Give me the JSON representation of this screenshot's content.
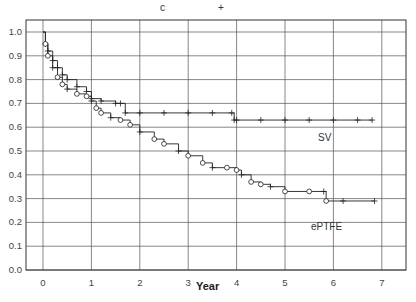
{
  "header_marks": {
    "circle_mark": "c",
    "plus_mark": "+"
  },
  "axes": {
    "xlabel": "Year",
    "xticks": [
      "0",
      "1",
      "2",
      "3",
      "4",
      "5",
      "6",
      "7"
    ],
    "yticks": [
      "1.0",
      "0.9",
      "0.8",
      "0.7",
      "0.6",
      "0.5",
      "0.4",
      "0.3",
      "0.2",
      "0.1",
      "0.0"
    ]
  },
  "labels": {
    "sv": "SV",
    "eptfe": "ePTFE"
  },
  "chart_data": {
    "type": "line",
    "subtype": "kaplan-meier step survival curve",
    "title": "",
    "xlabel": "Year",
    "ylabel": "",
    "xlim": [
      -0.1,
      7.5
    ],
    "ylim": [
      0.0,
      1.05
    ],
    "grid": true,
    "legend": "inline labels (SV above upper curve, ePTFE below lower curve)",
    "series": [
      {
        "name": "SV",
        "marker": "+ (censored)",
        "x": [
          0,
          0.05,
          0.1,
          0.2,
          0.3,
          0.4,
          0.5,
          0.7,
          0.9,
          1.0,
          1.2,
          1.5,
          1.6,
          1.7,
          2.0,
          2.5,
          3.0,
          3.5,
          3.9,
          3.95,
          4.0,
          4.5,
          5.0,
          5.5,
          6.0,
          6.5,
          6.8
        ],
        "y": [
          1.0,
          0.95,
          0.92,
          0.88,
          0.85,
          0.82,
          0.8,
          0.77,
          0.75,
          0.72,
          0.71,
          0.7,
          0.7,
          0.66,
          0.66,
          0.66,
          0.66,
          0.66,
          0.66,
          0.63,
          0.63,
          0.63,
          0.63,
          0.63,
          0.63,
          0.63,
          0.63
        ]
      },
      {
        "name": "ePTFE",
        "marker": "o (events) / + (censored)",
        "x": [
          0,
          0.05,
          0.1,
          0.2,
          0.3,
          0.4,
          0.5,
          0.7,
          0.9,
          1.0,
          1.1,
          1.2,
          1.4,
          1.6,
          1.8,
          2.0,
          2.3,
          2.5,
          2.8,
          3.0,
          3.3,
          3.5,
          3.8,
          4.0,
          4.1,
          4.3,
          4.5,
          4.7,
          5.0,
          5.5,
          5.8,
          5.85,
          6.2,
          6.85
        ],
        "y": [
          1.0,
          0.95,
          0.9,
          0.85,
          0.81,
          0.78,
          0.76,
          0.74,
          0.73,
          0.71,
          0.68,
          0.66,
          0.64,
          0.63,
          0.61,
          0.58,
          0.55,
          0.53,
          0.5,
          0.48,
          0.45,
          0.43,
          0.43,
          0.42,
          0.4,
          0.37,
          0.36,
          0.35,
          0.33,
          0.33,
          0.33,
          0.29,
          0.29,
          0.29
        ]
      }
    ]
  }
}
